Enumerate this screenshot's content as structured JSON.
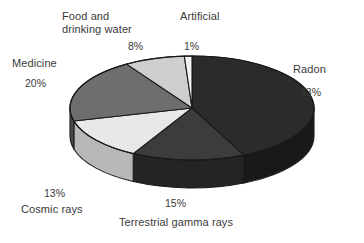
{
  "chart_data": {
    "type": "pie",
    "title": "",
    "subtitle": "",
    "xlabel": "",
    "ylabel": "",
    "legend_position": "none",
    "grid": false,
    "style": "3d-pie-grayscale",
    "units": "percent",
    "total": 100,
    "categories": [
      "Radon",
      "Terrestrial gamma rays",
      "Cosmic rays",
      "Medicine",
      "Food and drinking water",
      "Artificial"
    ],
    "values": [
      43,
      15,
      13,
      20,
      8,
      1
    ],
    "slices": [
      {
        "label": "Radon",
        "value": 43,
        "value_text": "43%",
        "color": "#2b2b2b",
        "side_color": "#191919",
        "start_angle_deg": 0,
        "end_angle_deg": 154.8
      },
      {
        "label": "Terrestrial gamma rays",
        "value": 15,
        "value_text": "15%",
        "color": "#3c3c3c",
        "side_color": "#242424",
        "start_angle_deg": 154.8,
        "end_angle_deg": 208.8
      },
      {
        "label": "Cosmic rays",
        "value": 13,
        "value_text": "13%",
        "color": "#e8e8e8",
        "side_color": "#b8b8b8",
        "start_angle_deg": 208.8,
        "end_angle_deg": 255.6
      },
      {
        "label": "Medicine",
        "value": 20,
        "value_text": "20%",
        "color": "#6e6e6e",
        "side_color": "#4a4a4a",
        "start_angle_deg": 255.6,
        "end_angle_deg": 327.6
      },
      {
        "label": "Food and drinking water",
        "value": 8,
        "value_text": "8%",
        "color": "#cfcfcf",
        "side_color": "#9a9a9a",
        "start_angle_deg": 327.6,
        "end_angle_deg": 356.4
      },
      {
        "label": "Artificial",
        "value": 1,
        "value_text": "1%",
        "color": "#f2f2f2",
        "side_color": "#c0c0c0",
        "start_angle_deg": 356.4,
        "end_angle_deg": 360
      }
    ]
  },
  "labels": {
    "food": {
      "line1": "Food and",
      "line2": "drinking water",
      "pct": "8%"
    },
    "artificial": {
      "name": "Artificial",
      "pct": "1%"
    },
    "medicine": {
      "name": "Medicine",
      "pct": "20%"
    },
    "radon": {
      "name": "Radon",
      "pct": "43%"
    },
    "cosmic": {
      "name": "Cosmic rays",
      "pct": "13%"
    },
    "terrestrial": {
      "name": "Terrestrial gamma rays",
      "pct": "15%"
    }
  },
  "geometry": {
    "cx": 192,
    "cy": 108,
    "rx": 122,
    "ry": 52,
    "depth": 28,
    "outline_color": "#1a1a1a"
  }
}
